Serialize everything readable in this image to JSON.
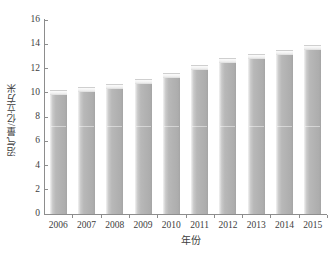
{
  "chart_data": {
    "type": "bar",
    "title": "",
    "xlabel": "年份",
    "ylabel": "沼气量/亿立方米",
    "categories": [
      "2006",
      "2007",
      "2008",
      "2009",
      "2010",
      "2011",
      "2012",
      "2013",
      "2014",
      "2015"
    ],
    "values": [
      10.2,
      10.5,
      10.7,
      11.1,
      11.6,
      12.3,
      12.9,
      13.2,
      13.5,
      13.9
    ],
    "ylim": [
      0,
      16
    ],
    "ytick_labels": [
      "0",
      "2",
      "4",
      "6",
      "8",
      "10",
      "12",
      "14",
      "16"
    ],
    "ytick_values": [
      0,
      2,
      4,
      6,
      8,
      10,
      12,
      14,
      16
    ],
    "grid": false,
    "legend": null,
    "series": [
      {
        "name": "沼气量",
        "values": [
          10.2,
          10.5,
          10.7,
          11.1,
          11.6,
          12.3,
          12.9,
          13.2,
          13.5,
          13.9
        ]
      }
    ],
    "bar_color": "#b3b3b3",
    "axis_color": "#8d8d8d",
    "text_color": "#3d3d3d",
    "background": "#ffffff"
  },
  "caption": {
    "text": ""
  }
}
